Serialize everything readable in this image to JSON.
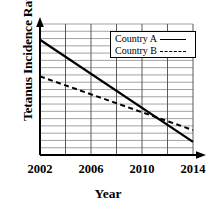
{
  "chart_data": {
    "type": "line",
    "title": "",
    "xlabel": "Year",
    "ylabel": "Tetanus Incidence Rate",
    "xlim": [
      2002,
      2014
    ],
    "ylim": [
      0,
      100
    ],
    "xticks": [
      "2002",
      "2006",
      "2010",
      "2014"
    ],
    "xtick_values": [
      2002,
      2006,
      2010,
      2014
    ],
    "yticks": [],
    "grid": true,
    "grid_vertical_step_years": 2,
    "legend_position": "top-right",
    "x": [
      2002,
      2014
    ],
    "series": [
      {
        "name": "Country A",
        "style": "solid",
        "color": "#000000",
        "values": [
          88,
          10
        ]
      },
      {
        "name": "Country B",
        "style": "dashed",
        "color": "#000000",
        "values": [
          60,
          19
        ]
      }
    ],
    "annotations": [
      {
        "label": "crossover",
        "x": 2012,
        "note": "Country A falls below Country B"
      }
    ]
  },
  "axes": {
    "x_arrow": "arrowhead-right",
    "y_arrow": "arrowhead-up",
    "axis_color": "#000000",
    "grid_color": "#8c8c8c",
    "plot_background": "#ffffff"
  },
  "legend": {
    "items": [
      {
        "label": "Country A",
        "swatch": "solid-line"
      },
      {
        "label": "Country B",
        "swatch": "dashed-line"
      }
    ]
  }
}
